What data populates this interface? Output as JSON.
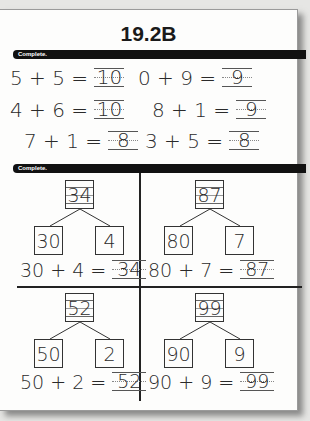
{
  "title": "19.2B",
  "section1": {
    "instruction": "Complete.",
    "equations": [
      {
        "lhs": "5 + 5 =",
        "answer": "10"
      },
      {
        "lhs": "0 + 9 =",
        "answer": "9"
      },
      {
        "lhs": "4 + 6 =",
        "answer": "10"
      },
      {
        "lhs": "8 + 1 =",
        "answer": "9"
      },
      {
        "lhs": "7 + 1 =",
        "answer": "8"
      },
      {
        "lhs": "3 + 5 =",
        "answer": "8"
      }
    ]
  },
  "section2": {
    "instruction": "Complete.",
    "bonds": [
      {
        "whole": "34",
        "tens": "30",
        "ones": "4",
        "equation": "30 + 4 =",
        "answer": "34"
      },
      {
        "whole": "87",
        "tens": "80",
        "ones": "7",
        "equation": "80 + 7 =",
        "answer": "87"
      },
      {
        "whole": "52",
        "tens": "50",
        "ones": "2",
        "equation": "50 + 2 =",
        "answer": "52"
      },
      {
        "whole": "99",
        "tens": "90",
        "ones": "9",
        "equation": "90 + 9 =",
        "answer": "99"
      }
    ]
  }
}
